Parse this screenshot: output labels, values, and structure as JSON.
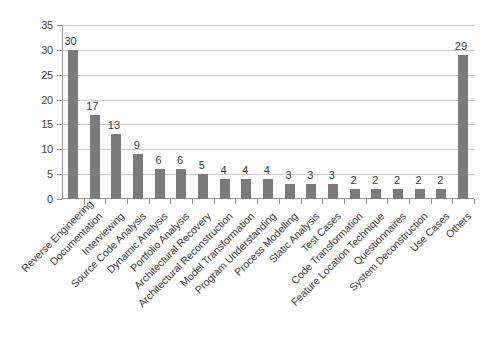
{
  "chart_data": {
    "type": "bar",
    "title": "",
    "subtitle": "",
    "xlabel": "",
    "ylabel": "",
    "ylim": [
      0,
      35
    ],
    "ytick_step": 5,
    "yticks": [
      0,
      5,
      10,
      15,
      20,
      25,
      30,
      35
    ],
    "grid": true,
    "legend": false,
    "legend_position": "none",
    "bar_color": "#7b7b7b",
    "gridline_color": "#c9c9c9",
    "axis_color": "#9a9a9a",
    "label_rotation_degrees": -45,
    "categories": [
      "Reverse Engineering",
      "Documentation",
      "Interviewing",
      "Source Code Analysis",
      "Dynamic Analysis",
      "Portfolio Analysis",
      "Architectural Recovery",
      "Architectural Reconstruction",
      "Model Transformation",
      "Program Understanding",
      "Process Modelling",
      "Static Analysis",
      "Test Cases",
      "Code Transformation",
      "Feature Location Technique",
      "Questionnaires",
      "System Deconstruction",
      "Use Cases",
      "Others"
    ],
    "values": [
      30,
      17,
      13,
      9,
      6,
      6,
      5,
      4,
      4,
      4,
      3,
      3,
      3,
      2,
      2,
      2,
      2,
      2,
      29
    ],
    "data_labels": [
      "30",
      "17",
      "13",
      "9",
      "6",
      "6",
      "5",
      "4",
      "4",
      "4",
      "3",
      "3",
      "3",
      "2",
      "2",
      "2",
      "2",
      "2",
      "29"
    ],
    "ytick_labels": [
      "0",
      "5",
      "10",
      "15",
      "20",
      "25",
      "30",
      "35"
    ]
  }
}
